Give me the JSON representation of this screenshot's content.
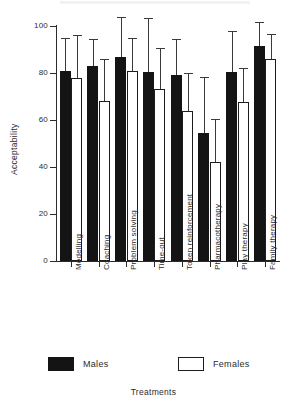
{
  "chart_data": {
    "type": "bar",
    "title": "",
    "subtitle": "",
    "xlabel": "Treatments",
    "ylabel": "Acceptability",
    "ylim": [
      0,
      100
    ],
    "yticks": [
      0,
      20,
      40,
      60,
      80,
      100
    ],
    "ytick_labels": [
      "0",
      "20",
      "40",
      "60",
      "80",
      "100"
    ],
    "grid": false,
    "legend_position": "bottom",
    "error_bars": "upper-only",
    "categories": [
      "Modelling",
      "Coaching",
      "Problem solving",
      "Time-out",
      "Token reinforcement",
      "Pharmacotherapy",
      "Play therapy",
      "Family therapy"
    ],
    "series": [
      {
        "name": "Males",
        "color": "#141414",
        "values": [
          81,
          83,
          87,
          80.5,
          79,
          54.5,
          80.5,
          91.5
        ],
        "error_upper": [
          95,
          94.5,
          104,
          103.5,
          94.5,
          78.5,
          98,
          101.5
        ]
      },
      {
        "name": "Females",
        "color": "#ffffff",
        "values": [
          78,
          68,
          81,
          73,
          64,
          42,
          67.5,
          86
        ],
        "error_upper": [
          96,
          86,
          95,
          90.5,
          80,
          60.5,
          82,
          96.5
        ]
      }
    ]
  },
  "legend": {
    "items": [
      {
        "label": "Males",
        "style": "filled"
      },
      {
        "label": "Females",
        "style": "outline"
      }
    ]
  }
}
